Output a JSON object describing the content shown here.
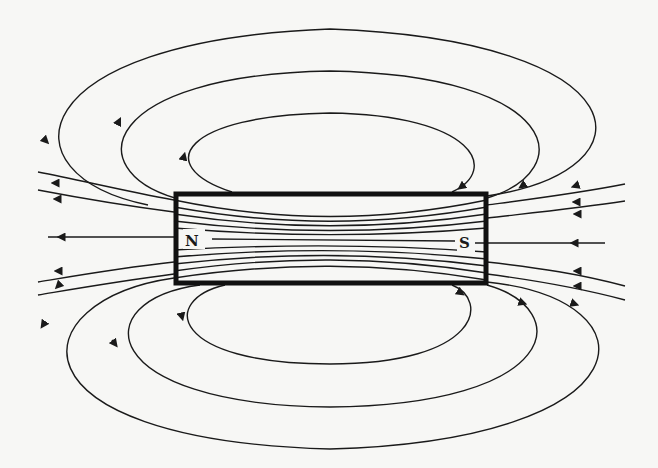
{
  "diagram": {
    "type": "bar-magnet-field-lines",
    "magnet": {
      "north_label": "N",
      "south_label": "S",
      "border_color": "#111111"
    },
    "field_line_color": "#1a1a1a",
    "background_color": "#f7f7f5",
    "loops": {
      "top_count": 3,
      "bottom_count": 3
    },
    "side_lines_per_side": 5,
    "interior_lines": 11
  }
}
